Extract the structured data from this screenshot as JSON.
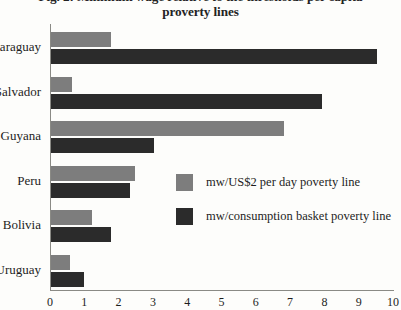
{
  "figure": {
    "title_line1": "Fig. 2: Minimum wage relative to the thresholds per capita",
    "title_line2": "proverty lines"
  },
  "colors": {
    "light_series": "#7d7d7d",
    "dark_series": "#2b2b2b",
    "axis": "#8a8a85",
    "text": "#1d1d1d",
    "background": "#fdfdfb"
  },
  "legend": {
    "position": "inside-right",
    "items": [
      {
        "label": "mw/US$2 per day poverty line",
        "swatch": "light"
      },
      {
        "label": "mw/consumption basket poverty line",
        "swatch": "dark"
      }
    ]
  },
  "axes": {
    "x_ticks": [
      "0",
      "1",
      "2",
      "3",
      "4",
      "5",
      "6",
      "7",
      "8",
      "9",
      "10"
    ],
    "y_categories": [
      "Paraguay",
      "El Salvador",
      "Guyana",
      "Peru",
      "Bolivia",
      "Uruguay"
    ],
    "xlabel": "",
    "ylabel": "",
    "grid": false
  },
  "chart_data": {
    "type": "bar",
    "orientation": "horizontal",
    "title": "Fig. 2: Minimum wage relative to the thresholds per capita proverty lines",
    "xlabel": "",
    "ylabel": "",
    "xlim": [
      0,
      10
    ],
    "grid": false,
    "legend_position": "inside-right",
    "categories": [
      "Paraguay",
      "El Salvador",
      "Guyana",
      "Peru",
      "Bolivia",
      "Uruguay"
    ],
    "series": [
      {
        "name": "mw/US$2 per day poverty line",
        "color": "#7d7d7d",
        "values": [
          1.75,
          0.6,
          6.8,
          2.45,
          1.2,
          0.55
        ]
      },
      {
        "name": "mw/consumption basket poverty line",
        "color": "#2b2b2b",
        "values": [
          9.5,
          7.9,
          3.0,
          2.3,
          1.75,
          0.95
        ]
      }
    ]
  }
}
